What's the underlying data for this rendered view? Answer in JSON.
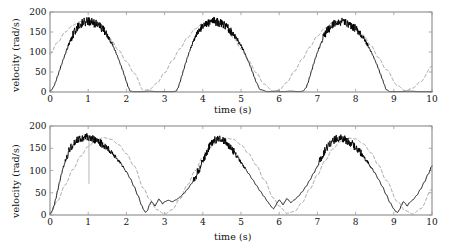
{
  "figure": {
    "title": "",
    "background": "#ffffff",
    "panels": 2
  },
  "chart_data": [
    {
      "id": "top-panel",
      "type": "line",
      "title": "",
      "xlabel": "time (s)",
      "ylabel": "velocity (rad/s)",
      "xlim": [
        0,
        10
      ],
      "ylim": [
        0,
        200
      ],
      "xticks": [
        0,
        1,
        2,
        3,
        4,
        5,
        6,
        7,
        8,
        9,
        10
      ],
      "yticks": [
        0,
        50,
        100,
        150,
        200
      ],
      "xticklabels": [
        "0",
        "1",
        "2",
        "3",
        "4",
        "5",
        "6",
        "7",
        "8",
        "9",
        "10"
      ],
      "yticklabels": [
        "0",
        "50",
        "100",
        "150",
        "200"
      ],
      "grid": false,
      "legend": null,
      "annotations": [],
      "series": [
        {
          "name": "measured velocity",
          "style": "solid",
          "color": "#000000",
          "linewidth": 0.9,
          "noise_band": 11,
          "noise_region": [
            0.55,
            1.45
          ],
          "comment": "saturates flat at zero between pulses",
          "x": [
            0.0,
            0.05,
            0.1,
            0.15,
            0.2,
            0.25,
            0.3,
            0.35,
            0.4,
            0.45,
            0.5,
            0.55,
            0.6,
            0.65,
            0.7,
            0.75,
            0.8,
            0.85,
            0.9,
            0.95,
            1.0,
            1.05,
            1.1,
            1.15,
            1.2,
            1.25,
            1.3,
            1.35,
            1.4,
            1.45,
            1.5,
            1.55,
            1.6,
            1.65,
            1.7,
            1.75,
            1.8,
            1.85,
            1.9,
            1.95,
            2.0,
            2.05,
            2.1,
            2.2,
            2.4,
            2.6,
            2.8,
            3.0,
            3.2,
            3.3,
            3.35,
            3.4,
            3.45,
            3.5,
            3.55,
            3.6,
            3.65,
            3.7,
            3.75,
            3.8,
            3.85,
            3.9,
            3.95,
            4.0,
            4.05,
            4.1,
            4.15,
            4.2,
            4.25,
            4.3,
            4.35,
            4.4,
            4.45,
            4.5,
            4.55,
            4.6,
            4.65,
            4.7,
            4.75,
            4.8,
            4.85,
            4.9,
            4.95,
            5.0,
            5.05,
            5.1,
            5.15,
            5.2,
            5.25,
            5.3,
            5.35,
            5.4,
            5.5,
            5.7,
            5.9,
            6.1,
            6.3,
            6.5,
            6.62,
            6.7,
            6.75,
            6.8,
            6.85,
            6.9,
            6.95,
            7.0,
            7.05,
            7.1,
            7.15,
            7.2,
            7.25,
            7.3,
            7.35,
            7.4,
            7.45,
            7.5,
            7.55,
            7.6,
            7.65,
            7.7,
            7.75,
            7.8,
            7.85,
            7.9,
            7.95,
            8.0,
            8.05,
            8.1,
            8.15,
            8.2,
            8.25,
            8.3,
            8.35,
            8.4,
            8.45,
            8.5,
            8.55,
            8.6,
            8.65,
            8.7,
            8.75,
            8.8,
            8.9,
            9.1,
            9.4,
            9.7,
            10.0
          ],
          "y": [
            2,
            6,
            14,
            26,
            40,
            54,
            68,
            82,
            95,
            108,
            120,
            132,
            143,
            152,
            160,
            166,
            170,
            173,
            175,
            176,
            176,
            175,
            174,
            172,
            170,
            167,
            164,
            160,
            155,
            149,
            142,
            134,
            125,
            115,
            104,
            93,
            81,
            68,
            55,
            41,
            26,
            12,
            2,
            1,
            1,
            2,
            1,
            1,
            1,
            2,
            10,
            24,
            40,
            56,
            72,
            87,
            101,
            114,
            126,
            137,
            146,
            154,
            160,
            165,
            169,
            172,
            174,
            175,
            176,
            176,
            175,
            174,
            172,
            170,
            167,
            164,
            160,
            156,
            151,
            145,
            139,
            132,
            124,
            116,
            107,
            97,
            86,
            75,
            63,
            50,
            37,
            24,
            6,
            1,
            2,
            1,
            2,
            1,
            2,
            10,
            22,
            38,
            54,
            70,
            85,
            99,
            112,
            124,
            135,
            144,
            152,
            158,
            163,
            167,
            170,
            172,
            174,
            175,
            175,
            174,
            173,
            171,
            169,
            166,
            162,
            158,
            153,
            148,
            142,
            135,
            128,
            120,
            111,
            102,
            92,
            81,
            70,
            58,
            45,
            32,
            19,
            6,
            1,
            1,
            2,
            1,
            1
          ]
        },
        {
          "name": "reference velocity",
          "style": "dashed",
          "color": "#8a8a8a",
          "linewidth": 0.8,
          "dash": "3,2.5",
          "x": [
            0.0,
            0.2,
            0.4,
            0.6,
            0.8,
            1.0,
            1.2,
            1.4,
            1.6,
            1.8,
            2.0,
            2.2,
            2.45,
            2.6,
            2.8,
            3.0,
            3.2,
            3.4,
            3.6,
            3.8,
            4.0,
            4.2,
            4.4,
            4.6,
            4.8,
            5.0,
            5.2,
            5.4,
            5.6,
            5.85,
            6.0,
            6.2,
            6.4,
            6.6,
            6.8,
            7.0,
            7.2,
            7.4,
            7.6,
            7.8,
            8.0,
            8.2,
            8.4,
            8.6,
            8.8,
            9.1,
            9.3,
            9.5,
            9.7,
            10.0
          ],
          "y": [
            95,
            124,
            150,
            167,
            176,
            176,
            168,
            152,
            130,
            104,
            76,
            47,
            4,
            6,
            22,
            48,
            78,
            108,
            136,
            158,
            172,
            177,
            172,
            158,
            136,
            108,
            78,
            48,
            20,
            1,
            5,
            24,
            52,
            82,
            112,
            140,
            160,
            174,
            178,
            174,
            162,
            142,
            116,
            86,
            56,
            16,
            3,
            10,
            26,
            64
          ]
        }
      ]
    },
    {
      "id": "bottom-panel",
      "type": "line",
      "title": "",
      "xlabel": "time (s)",
      "ylabel": "velocity (rad/s)",
      "xlim": [
        0,
        10
      ],
      "ylim": [
        0,
        200
      ],
      "xticks": [
        0,
        1,
        2,
        3,
        4,
        5,
        6,
        7,
        8,
        9,
        10
      ],
      "yticks": [
        0,
        50,
        100,
        150,
        200
      ],
      "xticklabels": [
        "0",
        "1",
        "2",
        "3",
        "4",
        "5",
        "6",
        "7",
        "8",
        "9",
        "10"
      ],
      "yticklabels": [
        "0",
        "50",
        "100",
        "150",
        "200"
      ],
      "grid": false,
      "legend": null,
      "annotations": [
        {
          "type": "vertical-line",
          "x": 1.02,
          "y_from": 70,
          "y_to": 168,
          "color": "#9a9a9a"
        }
      ],
      "series": [
        {
          "name": "measured velocity",
          "style": "solid",
          "color": "#000000",
          "linewidth": 0.9,
          "noise_band": 9,
          "noise_region": [
            0.45,
            1.55
          ],
          "comment": "does not saturate at zero; ripples near troughs",
          "x": [
            0.0,
            0.05,
            0.1,
            0.15,
            0.2,
            0.25,
            0.3,
            0.35,
            0.4,
            0.45,
            0.5,
            0.55,
            0.6,
            0.65,
            0.7,
            0.75,
            0.8,
            0.85,
            0.9,
            0.95,
            1.0,
            1.05,
            1.1,
            1.15,
            1.2,
            1.25,
            1.3,
            1.35,
            1.4,
            1.45,
            1.5,
            1.6,
            1.7,
            1.8,
            1.9,
            2.0,
            2.1,
            2.2,
            2.3,
            2.4,
            2.45,
            2.5,
            2.55,
            2.6,
            2.65,
            2.7,
            2.75,
            2.8,
            2.85,
            2.9,
            2.95,
            3.0,
            3.1,
            3.2,
            3.3,
            3.4,
            3.5,
            3.6,
            3.7,
            3.8,
            3.9,
            4.0,
            4.1,
            4.2,
            4.3,
            4.4,
            4.5,
            4.6,
            4.7,
            4.8,
            4.9,
            5.0,
            5.1,
            5.2,
            5.3,
            5.4,
            5.5,
            5.6,
            5.7,
            5.75,
            5.8,
            5.85,
            5.9,
            5.95,
            6.0,
            6.05,
            6.1,
            6.15,
            6.2,
            6.25,
            6.3,
            6.4,
            6.5,
            6.6,
            6.7,
            6.8,
            6.9,
            7.0,
            7.1,
            7.2,
            7.3,
            7.4,
            7.5,
            7.6,
            7.7,
            7.8,
            7.9,
            8.0,
            8.1,
            8.2,
            8.3,
            8.4,
            8.5,
            8.6,
            8.7,
            8.8,
            8.9,
            9.0,
            9.05,
            9.1,
            9.15,
            9.2,
            9.25,
            9.3,
            9.35,
            9.4,
            9.5,
            9.6,
            9.7,
            9.8,
            9.9,
            10.0
          ],
          "y": [
            2,
            8,
            20,
            36,
            55,
            74,
            92,
            108,
            122,
            134,
            144,
            152,
            158,
            163,
            167,
            170,
            172,
            174,
            175,
            175,
            174,
            173,
            172,
            170,
            168,
            166,
            163,
            160,
            157,
            153,
            149,
            141,
            132,
            122,
            110,
            97,
            82,
            64,
            44,
            22,
            12,
            6,
            10,
            22,
            30,
            26,
            20,
            28,
            36,
            31,
            25,
            30,
            33,
            30,
            34,
            40,
            48,
            58,
            70,
            85,
            100,
            120,
            140,
            158,
            168,
            172,
            170,
            164,
            155,
            144,
            132,
            119,
            106,
            93,
            80,
            67,
            54,
            42,
            30,
            24,
            18,
            14,
            20,
            28,
            34,
            29,
            23,
            30,
            37,
            33,
            28,
            34,
            42,
            52,
            64,
            78,
            94,
            110,
            128,
            145,
            158,
            167,
            171,
            172,
            170,
            166,
            160,
            152,
            143,
            132,
            120,
            108,
            95,
            80,
            64,
            46,
            28,
            14,
            8,
            6,
            12,
            22,
            30,
            26,
            20,
            27,
            34,
            44,
            58,
            74,
            92,
            110
          ]
        },
        {
          "name": "reference velocity",
          "style": "dashed",
          "color": "#8a8a8a",
          "linewidth": 0.8,
          "dash": "3,2.5",
          "x": [
            0.0,
            0.2,
            0.4,
            0.6,
            0.8,
            1.0,
            1.2,
            1.4,
            1.6,
            1.8,
            2.0,
            2.2,
            2.45,
            2.6,
            2.8,
            3.0,
            3.2,
            3.4,
            3.6,
            3.8,
            4.0,
            4.2,
            4.4,
            4.6,
            4.8,
            5.0,
            5.2,
            5.4,
            5.6,
            5.85,
            6.0,
            6.2,
            6.4,
            6.6,
            6.8,
            7.0,
            7.2,
            7.4,
            7.6,
            7.8,
            8.0,
            8.2,
            8.4,
            8.6,
            8.8,
            9.1,
            9.3,
            9.5,
            9.7,
            10.0
          ],
          "y": [
            2,
            32,
            68,
            102,
            132,
            154,
            168,
            174,
            170,
            158,
            138,
            110,
            60,
            36,
            12,
            2,
            12,
            36,
            68,
            100,
            130,
            152,
            166,
            173,
            170,
            158,
            138,
            112,
            80,
            38,
            20,
            4,
            8,
            28,
            58,
            90,
            122,
            148,
            165,
            173,
            171,
            160,
            140,
            112,
            78,
            30,
            10,
            2,
            14,
            58
          ]
        }
      ]
    }
  ]
}
